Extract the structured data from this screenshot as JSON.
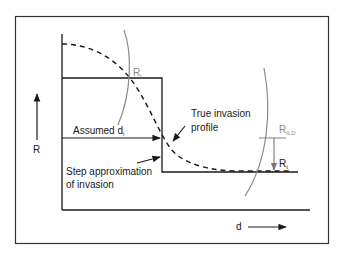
{
  "diagram": {
    "axes": {
      "y_label": "R",
      "x_label": "d"
    },
    "labels": {
      "ri": {
        "base": "R",
        "sub": "i"
      },
      "rt": {
        "base": "R",
        "sub": "t"
      },
      "rild": {
        "base": "R",
        "sub": "ILD"
      },
      "assumed": {
        "text": "Assumed d",
        "sub": "i"
      },
      "true_profile_line1": "True invasion",
      "true_profile_line2": "profile",
      "step_line1": "Step approximation",
      "step_line2": "of invasion"
    },
    "colors": {
      "line": "#1a1a1a",
      "gray_curve": "#8a8a8a",
      "background": "#ffffff"
    }
  }
}
